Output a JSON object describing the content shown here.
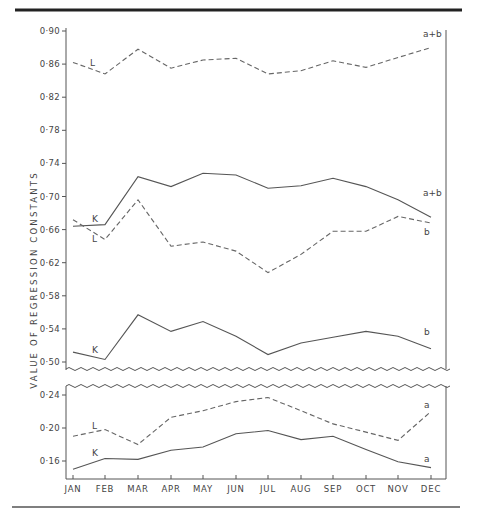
{
  "chart_data": {
    "type": "line",
    "title": "",
    "xlabel": "",
    "ylabel": "VALUE OF REGRESSION CONSTANTS",
    "categories": [
      "JAN",
      "FEB",
      "MAR",
      "APR",
      "MAY",
      "JUN",
      "JUL",
      "AUG",
      "SEP",
      "OCT",
      "NOV",
      "DEC"
    ],
    "grid": false,
    "legend": "inline labels",
    "panels": [
      {
        "name": "upper",
        "ylim": [
          0.49,
          0.9
        ],
        "yticks": [
          "0.90",
          "0.86",
          "0.82",
          "0.78",
          "0.74",
          "0.70",
          "0.66",
          "0.62",
          "0.58",
          "0.54",
          "0.50"
        ],
        "series": [
          {
            "name": "L (a+b)",
            "station": "L",
            "constant": "a+b",
            "style": "dashed",
            "values": [
              0.862,
              0.848,
              0.878,
              0.855,
              0.865,
              0.867,
              0.848,
              0.852,
              0.864,
              0.856,
              0.868,
              0.88
            ]
          },
          {
            "name": "K (a+b)",
            "station": "K",
            "constant": "a+b",
            "style": "solid",
            "values": [
              0.664,
              0.666,
              0.724,
              0.712,
              0.728,
              0.726,
              0.71,
              0.713,
              0.722,
              0.712,
              0.696,
              0.675
            ]
          },
          {
            "name": "L (b)",
            "station": "L",
            "constant": "b",
            "style": "dashed",
            "values": [
              0.672,
              0.648,
              0.696,
              0.64,
              0.645,
              0.634,
              0.608,
              0.63,
              0.658,
              0.658,
              0.676,
              0.668
            ]
          },
          {
            "name": "K (b)",
            "station": "K",
            "constant": "b",
            "style": "solid",
            "values": [
              0.512,
              0.503,
              0.557,
              0.537,
              0.549,
              0.531,
              0.509,
              0.523,
              0.53,
              0.537,
              0.531,
              0.516
            ]
          }
        ]
      },
      {
        "name": "lower",
        "ylim": [
          0.135,
          0.25
        ],
        "yticks": [
          "0.24",
          "0.20",
          "0.16"
        ],
        "series": [
          {
            "name": "L (a)",
            "station": "L",
            "constant": "a",
            "style": "dashed",
            "values": [
              0.19,
              0.198,
              0.18,
              0.213,
              0.221,
              0.232,
              0.237,
              0.221,
              0.205,
              0.195,
              0.185,
              0.22
            ]
          },
          {
            "name": "K (a)",
            "station": "K",
            "constant": "a",
            "style": "solid",
            "values": [
              0.15,
              0.163,
              0.162,
              0.173,
              0.177,
              0.193,
              0.197,
              0.186,
              0.19,
              0.174,
              0.159,
              0.152
            ]
          }
        ]
      }
    ],
    "annotations": [
      {
        "text": "L",
        "near": "L (a+b) at JAN-FEB"
      },
      {
        "text": "a+b",
        "near": "L (a+b) at DEC"
      },
      {
        "text": "K",
        "near": "K (a+b) at FEB"
      },
      {
        "text": "L",
        "near": "L (b) at FEB"
      },
      {
        "text": "a+b",
        "near": "K (a+b) at DEC"
      },
      {
        "text": "b",
        "near": "L (b) at DEC"
      },
      {
        "text": "K",
        "near": "K (b) at FEB"
      },
      {
        "text": "b",
        "near": "K (b) at DEC"
      },
      {
        "text": "L",
        "near": "L (a) at FEB"
      },
      {
        "text": "a",
        "near": "L (a) at DEC"
      },
      {
        "text": "K",
        "near": "K (a) at FEB"
      },
      {
        "text": "a",
        "near": "K (a) at DEC"
      }
    ]
  },
  "labels": {
    "y_axis_title": "VALUE OF REGRESSION CONSTANTS",
    "series_tags": {
      "L": "L",
      "K": "K",
      "a_plus_b": "a+b",
      "b": "b",
      "a": "a"
    }
  }
}
